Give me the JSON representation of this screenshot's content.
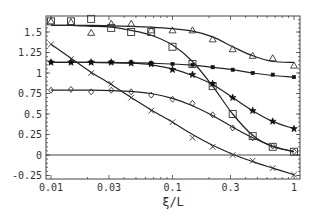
{
  "chart_data": {
    "type": "line",
    "title": "",
    "xlabel": "ξ/L",
    "ylabel": "",
    "xscale": "log",
    "xlim": [
      0.0095,
      1.1
    ],
    "ylim": [
      -0.29,
      1.7
    ],
    "grid": false,
    "legend": null,
    "x_ticks": [
      {
        "value": 0.01,
        "label": "0.01"
      },
      {
        "value": 0.03,
        "label": "0.03"
      },
      {
        "value": 0.1,
        "label": "0.1"
      },
      {
        "value": 0.3,
        "label": "0.3"
      },
      {
        "value": 1,
        "label": "1"
      }
    ],
    "y_ticks": [
      {
        "value": 1.5,
        "label": "1.5"
      },
      {
        "value": 1.25,
        "label": "1.25"
      },
      {
        "value": 1.0,
        "label": "1"
      },
      {
        "value": 0.75,
        "label": "0.75"
      },
      {
        "value": 0.5,
        "label": "0.5"
      },
      {
        "value": 0.25,
        "label": "0.25"
      },
      {
        "value": 0,
        "label": "0"
      },
      {
        "value": -0.25,
        "label": "-0.25"
      }
    ],
    "reference_lines": [
      {
        "axis": "y",
        "value": 0
      }
    ],
    "x": [
      0.01,
      0.0146,
      0.0214,
      0.0313,
      0.0457,
      0.0668,
      0.1,
      0.146,
      0.214,
      0.313,
      0.457,
      0.668,
      1.0
    ],
    "series": [
      {
        "name": "triangles",
        "marker": "triangle",
        "values": [
          1.63,
          1.62,
          1.49,
          1.6,
          1.6,
          1.52,
          1.52,
          1.52,
          1.41,
          1.29,
          1.21,
          1.18,
          1.09
        ],
        "curve": [
          1.58,
          1.58,
          1.58,
          1.575,
          1.57,
          1.56,
          1.54,
          1.51,
          1.44,
          1.32,
          1.21,
          1.14,
          1.13
        ]
      },
      {
        "name": "squares",
        "marker": "square",
        "values": [
          1.63,
          1.63,
          1.66,
          1.55,
          1.5,
          1.5,
          1.32,
          1.11,
          0.84,
          0.5,
          0.23,
          0.1,
          0.04
        ],
        "curve": [
          1.58,
          1.58,
          1.57,
          1.56,
          1.52,
          1.46,
          1.34,
          1.14,
          0.84,
          0.5,
          0.24,
          0.1,
          0.04
        ]
      },
      {
        "name": "small-dots",
        "marker": "dot",
        "values": [
          1.13,
          1.13,
          1.13,
          1.13,
          1.13,
          1.12,
          1.11,
          1.1,
          1.07,
          1.04,
          1.0,
          0.98,
          0.95
        ],
        "curve": [
          1.13,
          1.13,
          1.13,
          1.13,
          1.125,
          1.12,
          1.11,
          1.095,
          1.07,
          1.04,
          1.0,
          0.97,
          0.95
        ]
      },
      {
        "name": "stars",
        "marker": "star",
        "values": [
          1.13,
          1.13,
          1.13,
          1.13,
          1.12,
          1.11,
          1.04,
          0.98,
          0.87,
          0.7,
          0.54,
          0.41,
          0.32
        ],
        "curve": [
          1.13,
          1.13,
          1.13,
          1.125,
          1.12,
          1.1,
          1.05,
          0.97,
          0.86,
          0.7,
          0.54,
          0.41,
          0.32
        ]
      },
      {
        "name": "diamonds",
        "marker": "diamond",
        "values": [
          0.79,
          0.8,
          0.77,
          0.79,
          0.77,
          0.73,
          0.68,
          0.63,
          0.49,
          0.33,
          0.21,
          0.11,
          0.04
        ],
        "curve": [
          0.79,
          0.79,
          0.79,
          0.785,
          0.775,
          0.75,
          0.69,
          0.6,
          0.48,
          0.34,
          0.21,
          0.11,
          0.04
        ]
      },
      {
        "name": "crosses",
        "marker": "cross",
        "values": [
          1.35,
          1.17,
          1.0,
          0.87,
          0.7,
          0.54,
          0.4,
          0.21,
          0.1,
          0.0,
          -0.07,
          -0.16,
          -0.24
        ],
        "curve": [
          1.35,
          1.18,
          1.01,
          0.86,
          0.7,
          0.55,
          0.4,
          0.25,
          0.12,
          0.01,
          -0.08,
          -0.16,
          -0.24
        ]
      }
    ]
  }
}
